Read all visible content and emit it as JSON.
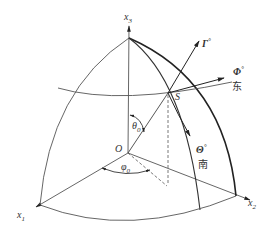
{
  "diagram": {
    "type": "spherical-coordinate-octant",
    "colors": {
      "line": "#444444",
      "thick": "#222222",
      "text": "#333333",
      "background": "#ffffff"
    },
    "labels": {
      "x3": "x",
      "x3_sub": "3",
      "x1": "x",
      "x1_sub": "1",
      "x2": "x",
      "x2_sub": "2",
      "origin": "O",
      "point_s": "S",
      "theta0": "θ",
      "theta0_sub": "0",
      "phi0": "φ",
      "phi0_sub": "0",
      "gamma_vec": "Γ",
      "gamma_sup": "°",
      "phi_vec": "Φ",
      "phi_sup": "°",
      "theta_vec": "Θ",
      "theta_sup": "°",
      "east": "东",
      "south": "南"
    }
  }
}
